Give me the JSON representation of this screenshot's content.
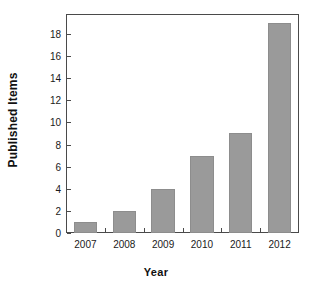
{
  "chart_data": {
    "type": "bar",
    "title": "",
    "subtitle": "",
    "xlabel": "Year",
    "ylabel": "Published Items",
    "categories": [
      "2007",
      "2008",
      "2009",
      "2010",
      "2011",
      "2012"
    ],
    "values": [
      1,
      2,
      4,
      7,
      9,
      19
    ],
    "series": [
      {
        "name": "Published Items",
        "values": [
          1,
          2,
          4,
          7,
          9,
          19
        ]
      }
    ],
    "ylim": [
      0,
      19.8
    ],
    "xlim": [
      0,
      6
    ],
    "y_ticks": [
      0,
      2,
      4,
      6,
      8,
      10,
      12,
      14,
      16,
      18
    ],
    "y_tick_labels": [
      "0",
      "2",
      "4",
      "6",
      "8",
      "10",
      "12",
      "14",
      "16",
      "18"
    ],
    "x_tick_labels": [
      "2007",
      "2008",
      "2009",
      "2010",
      "2011",
      "2012"
    ],
    "grid": false,
    "legend": false,
    "legend_position": "none",
    "annotations": [],
    "colors": {
      "bar_fill": "#9a9a9a",
      "bar_stroke": "#8d8d8d",
      "axis": "#4a4a4a",
      "text": "#111111",
      "background": "#ffffff"
    }
  },
  "axes": {
    "y_title": "Published Items",
    "x_title": "Year"
  }
}
